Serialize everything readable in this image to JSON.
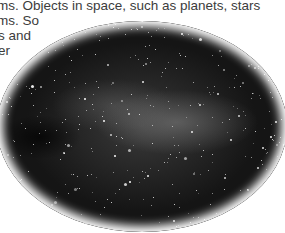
{
  "text": {
    "lines": [
      "ms. Objects in space, such as planets, stars",
      "ms. So",
      "s and",
      "er"
    ]
  },
  "image": {
    "description": "Oval-cropped photograph of the starry night sky / Milky Way",
    "shape": "ellipse",
    "colors": {
      "background": "#151515",
      "glow": "#8a8a8a",
      "stars": "#ffffff"
    }
  }
}
